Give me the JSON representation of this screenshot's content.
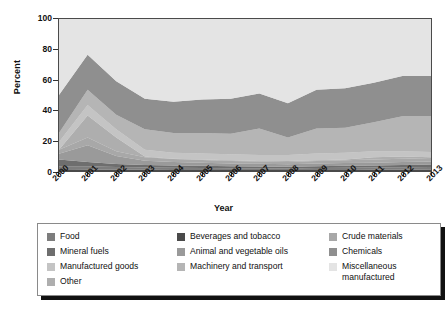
{
  "chart_data": {
    "type": "area",
    "title": "",
    "xlabel": "Year",
    "ylabel": "Percent",
    "ylim": [
      0,
      100
    ],
    "yticks": [
      0,
      20,
      40,
      60,
      80,
      100
    ],
    "xticks": [
      "2000",
      "2001",
      "2002",
      "2003",
      "2004",
      "2005",
      "2006",
      "2007",
      "2008",
      "2009",
      "2010",
      "2011",
      "2012",
      "2013"
    ],
    "categories": [
      "2000",
      "2001",
      "2002",
      "2003",
      "2004",
      "2005",
      "2006",
      "2007",
      "2008",
      "2009",
      "2010",
      "2011",
      "2012",
      "2013"
    ],
    "grid": false,
    "stacked": true,
    "legend_position": "bottom",
    "series": [
      {
        "name": "Food",
        "color": "#7d7d7d",
        "values": [
          2.0,
          2.2,
          1.8,
          1.5,
          1.4,
          1.3,
          1.2,
          1.2,
          1.1,
          1.3,
          1.4,
          1.5,
          1.6,
          1.7
        ]
      },
      {
        "name": "Beverages and tobacco",
        "color": "#4a4a4a",
        "values": [
          1.2,
          1.0,
          0.9,
          0.8,
          0.7,
          0.7,
          0.6,
          0.6,
          0.6,
          0.7,
          0.7,
          0.8,
          0.9,
          1.0
        ]
      },
      {
        "name": "Crude materials",
        "color": "#a8a8a8",
        "values": [
          2.6,
          5.0,
          3.2,
          2.2,
          1.9,
          1.7,
          1.6,
          1.5,
          1.4,
          1.6,
          1.8,
          2.0,
          2.2,
          2.4
        ]
      },
      {
        "name": "Mineral fuels",
        "color": "#6e6e6e",
        "values": [
          4.4,
          2.8,
          1.9,
          1.6,
          1.5,
          1.4,
          1.3,
          1.2,
          1.1,
          1.2,
          1.3,
          1.3,
          1.4,
          1.5
        ]
      },
      {
        "name": "Animal and vegetable oils",
        "color": "#9a9a9a",
        "values": [
          3.8,
          11.0,
          5.2,
          2.9,
          2.4,
          2.1,
          1.9,
          1.8,
          1.7,
          1.8,
          1.9,
          1.9,
          2.0,
          2.0
        ]
      },
      {
        "name": "Chemicals",
        "color": "#8f8f8f",
        "values": [
          25.0,
          23.0,
          22.0,
          20.0,
          20.5,
          22.0,
          23.0,
          23.0,
          22.5,
          25.5,
          26.0,
          26.0,
          26.5,
          26.5
        ]
      },
      {
        "name": "Manufactured goods",
        "color": "#c4c4c4",
        "values": [
          5.0,
          7.0,
          5.5,
          4.5,
          4.0,
          4.0,
          4.0,
          4.0,
          4.0,
          4.5,
          4.5,
          4.0,
          3.5,
          3.5
        ]
      },
      {
        "name": "Machinery and transport",
        "color": "#b5b5b5",
        "values": [
          6.0,
          10.0,
          9.5,
          13.5,
          13.0,
          13.5,
          13.5,
          17.5,
          11.5,
          16.5,
          16.5,
          19.0,
          23.0,
          23.5
        ]
      },
      {
        "name": "Miscellaneous manufactured",
        "color": "#e4e4e4",
        "values": [
          50.0,
          23.5,
          41.0,
          52.5,
          54.5,
          53.0,
          52.5,
          49.0,
          56.5,
          46.5,
          45.5,
          42.0,
          37.5,
          37.5
        ]
      },
      {
        "name": "Other",
        "color": "#aeaeae",
        "values": [
          0.0,
          14.5,
          9.0,
          0.5,
          0.1,
          0.3,
          0.4,
          0.2,
          0.6,
          0.4,
          0.4,
          1.5,
          1.4,
          0.4
        ]
      }
    ],
    "stack_order": [
      "Beverages and tobacco",
      "Food",
      "Mineral fuels",
      "Animal and vegetable oils",
      "Crude materials",
      "Other",
      "Manufactured goods",
      "Machinery and transport",
      "Chemicals",
      "Miscellaneous manufactured"
    ]
  },
  "axes": {
    "ylabel": "Percent",
    "xlabel": "Year",
    "yticks": [
      "0",
      "20",
      "40",
      "60",
      "80",
      "100"
    ],
    "xticks": [
      "2000",
      "2001",
      "2002",
      "2003",
      "2004",
      "2005",
      "2006",
      "2007",
      "2008",
      "2009",
      "2010",
      "2011",
      "2012",
      "2013"
    ]
  },
  "legend": {
    "columns": [
      [
        {
          "label": "Food",
          "color": "#7d7d7d"
        },
        {
          "label": "Mineral fuels",
          "color": "#6e6e6e"
        },
        {
          "label": "Manufactured goods",
          "color": "#c4c4c4"
        },
        {
          "label": "Other",
          "color": "#aeaeae"
        }
      ],
      [
        {
          "label": "Beverages and tobacco",
          "color": "#4a4a4a"
        },
        {
          "label": "Animal and vegetable oils",
          "color": "#9a9a9a"
        },
        {
          "label": "Machinery and transport",
          "color": "#b5b5b5"
        }
      ],
      [
        {
          "label": "Crude materials",
          "color": "#a8a8a8"
        },
        {
          "label": "Chemicals",
          "color": "#8f8f8f"
        },
        {
          "label": "Miscellaneous\nmanufactured",
          "color": "#e4e4e4"
        }
      ]
    ]
  }
}
